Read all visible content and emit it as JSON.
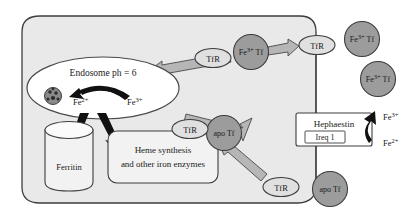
{
  "diagram": {
    "cell": {
      "name": "cell-body",
      "fill": "#e9e9e9",
      "stroke": "#3d3d3d"
    },
    "endosome": {
      "label": "Endosome ph = 6",
      "fill": "#ffffff",
      "stroke": "#4a4a4a",
      "transporter_icon": "dmt1-transporter-icon",
      "iron_reduced": {
        "element": "Fe",
        "charge": "2+"
      },
      "iron_oxidized": {
        "element": "Fe",
        "charge": "3+"
      }
    },
    "ferritin": {
      "label": "Ferritin",
      "shape": "cylinder",
      "fill": "#f2f2f2"
    },
    "heme_box": {
      "line1": "Heme synthesis",
      "line2": "and other iron enzymes",
      "fill": "#f2f2f2"
    },
    "hephaestin_box": {
      "label": "Hephaestin",
      "sub_label": "Ireq 1",
      "fill": "#ffffff"
    },
    "hephaestin_iron": [
      {
        "element": "Fe",
        "charge": "3+"
      },
      {
        "element": "Fe",
        "charge": "2+"
      }
    ],
    "receptors": [
      {
        "id": "tfr-endosome",
        "label": "TfR"
      },
      {
        "id": "tfr-internalizing",
        "label": "TfR"
      },
      {
        "id": "tfr-membrane",
        "label": "TfR"
      },
      {
        "id": "tfr-apo-complex",
        "label": "TfR"
      },
      {
        "id": "tfr-recycled",
        "label": "TfR"
      }
    ],
    "ligands": [
      {
        "id": "fe3-tf-internalized",
        "element": "Fe",
        "charge": "3+",
        "protein": "Tf"
      },
      {
        "id": "fe3-tf-surface",
        "element": "Fe",
        "charge": "3+",
        "protein": "Tf"
      },
      {
        "id": "fe3-tf-extracellular",
        "element": "Fe",
        "charge": "3+",
        "protein": "Tf"
      },
      {
        "id": "apo-tf-bound",
        "label": "apo Tf"
      },
      {
        "id": "apo-tf-released",
        "label": "apo Tf"
      }
    ],
    "colors": {
      "ligand_fill": "#9c9c9c",
      "receptor_fill": "#e0e0e0",
      "block_arrow_fill": "#b6b6b6",
      "solid_arrow_fill": "#111111",
      "outline": "#3d3d3d"
    }
  }
}
